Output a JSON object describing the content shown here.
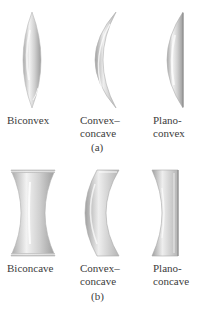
{
  "figure": {
    "part_a": {
      "caption": "(a)",
      "lenses": [
        {
          "name": "biconvex",
          "label_line1": "Biconvex",
          "label_line2": ""
        },
        {
          "name": "convex-concave",
          "label_line1": "Convex–",
          "label_line2": "concave"
        },
        {
          "name": "plano-convex",
          "label_line1": "Plano-",
          "label_line2": "convex"
        }
      ]
    },
    "part_b": {
      "caption": "(b)",
      "lenses": [
        {
          "name": "biconcave",
          "label_line1": "Biconcave",
          "label_line2": ""
        },
        {
          "name": "convex-concave",
          "label_line1": "Convex–",
          "label_line2": "concave"
        },
        {
          "name": "plano-concave",
          "label_line1": "Plano-",
          "label_line2": "concave"
        }
      ]
    },
    "colors": {
      "lens_light": "#f4f4f4",
      "lens_mid": "#c8c8c8",
      "lens_dark": "#9a9a9a",
      "text": "#3c3c3c"
    }
  }
}
